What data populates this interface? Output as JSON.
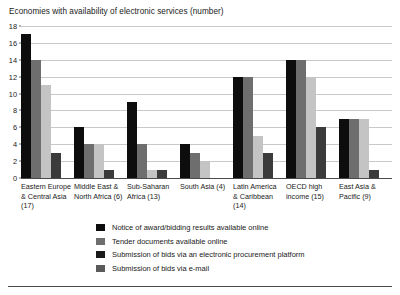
{
  "chart_data": {
    "type": "bar",
    "title": "Economies with availability of electronic services (number)",
    "xlabel": "",
    "ylabel": "",
    "ylim": [
      0,
      18
    ],
    "ytick_step": 2,
    "yticks": [
      18,
      16,
      14,
      12,
      10,
      8,
      6,
      4,
      2,
      0
    ],
    "grid": true,
    "legend_position": "bottom",
    "categories": [
      "Eastern Europe & Central Asia (17)",
      "Middle East & North Africa (6)",
      "Sub-Saharan Africa (13)",
      "South Asia (4)",
      "Latin America & Caribbean (14)",
      "OECD high income (15)",
      "East Asia & Pacific (9)"
    ],
    "series": [
      {
        "name": "Notice of award/bidding results available online",
        "color": "#0d0d0d",
        "values": [
          17,
          6,
          9,
          4,
          12,
          14,
          7
        ]
      },
      {
        "name": "Tender documents available online",
        "color": "#6e6e6e",
        "values": [
          14,
          4,
          4,
          3,
          12,
          14,
          7
        ]
      },
      {
        "name": "Submission of bids via an electronic procurement platform",
        "color": "#c4c4c4",
        "values": [
          11,
          4,
          1,
          2,
          5,
          12,
          7
        ]
      },
      {
        "name": "Submission of bids via e-mail",
        "color": "#3b3b3b",
        "values": [
          3,
          1,
          1,
          0,
          3,
          6,
          1
        ]
      }
    ]
  }
}
